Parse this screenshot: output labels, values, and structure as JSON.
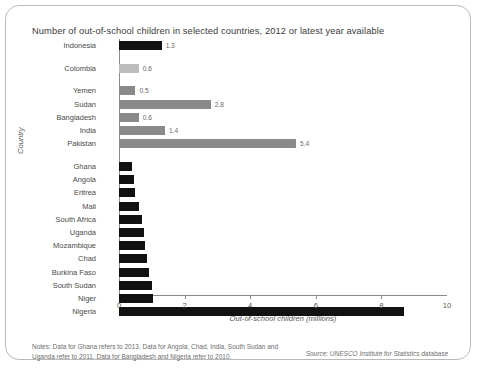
{
  "title": "Number of out-of-school children in selected countries, 2012 or latest year available",
  "notes": "Notes: Data for Ghana refers to 2013. Data for Angola, Chad, India, South Sudan and Uganda refer to 2011. Data for Bangladesh and Nigeria refer to 2010.",
  "source": "Source: UNESCO Institute for Statistics database",
  "colors": {
    "black": "#111111",
    "light_gray": "#bdbdbd",
    "mid_gray": "#8a8a8a",
    "axis": "#8b8b8b",
    "frame": "#b9b9b9",
    "text": "#4a4a4a"
  },
  "chart_data": {
    "type": "bar",
    "orientation": "horizontal",
    "title": "Number of out-of-school children in selected countries, 2012 or latest year available",
    "xlabel": "Out-of-school children (millions)",
    "ylabel": "Country",
    "xlim": [
      0,
      10
    ],
    "xticks": [
      0,
      2,
      4,
      6,
      8,
      10
    ],
    "grid": false,
    "legend": null,
    "categories": [
      "Indonesia",
      "Colombia",
      "Yemen",
      "Sudan",
      "Bangladesh",
      "India",
      "Pakistan",
      "Ghana",
      "Angola",
      "Eritrea",
      "Mali",
      "South Africa",
      "Uganda",
      "Mozambique",
      "Chad",
      "Burkina Faso",
      "South Sudan",
      "Niger",
      "Nigeria"
    ],
    "values": [
      1.3,
      0.6,
      0.5,
      2.8,
      0.6,
      1.4,
      5.4,
      0.4,
      0.45,
      0.5,
      0.6,
      0.7,
      0.75,
      0.8,
      0.85,
      0.9,
      1.0,
      1.05,
      8.7
    ],
    "bar_colors": [
      "black",
      "light_gray",
      "mid_gray",
      "mid_gray",
      "mid_gray",
      "mid_gray",
      "mid_gray",
      "black",
      "black",
      "black",
      "black",
      "black",
      "black",
      "black",
      "black",
      "black",
      "black",
      "black",
      "black"
    ],
    "data_labels": [
      "1.3",
      "0.6",
      "0.5",
      "2.8",
      "0.6",
      "1.4",
      "5.4",
      "",
      "",
      "",
      "",
      "",
      "",
      "",
      "",
      "",
      "",
      "",
      ""
    ],
    "group_breaks_after": [
      0,
      1,
      6
    ]
  }
}
